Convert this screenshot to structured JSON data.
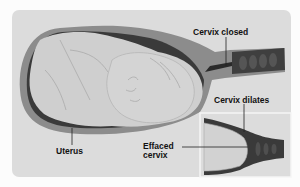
{
  "diagram": {
    "labels": {
      "cervix_closed": "Cervix closed",
      "cervix_dilates": "Cervix dilates",
      "effaced_cervix_line1": "Effaced",
      "effaced_cervix_line2": "cervix",
      "uterus": "Uterus"
    },
    "inset": "Close-up of dilating, effaced cervix"
  },
  "colors": {
    "background": "#fcfcfc",
    "panel": "#dcdcdc",
    "uterus_wall": "#8c8c8c",
    "uterus_inner_dark": "#3a3a3a",
    "fetus": "#cfcfcf",
    "fetus_outline": "#b0b0b0",
    "cervix_canal": "#4a4a4a",
    "text": "#111111"
  }
}
